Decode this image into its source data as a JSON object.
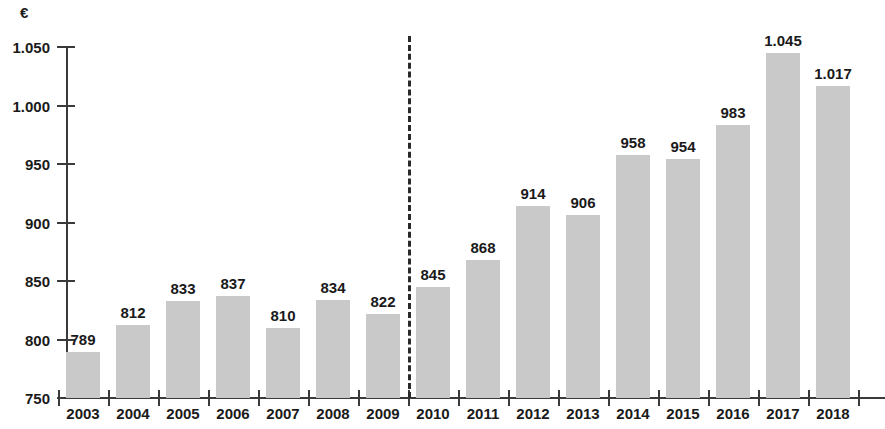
{
  "chart_data": {
    "type": "bar",
    "title": "",
    "subtitle": "",
    "xlabel": "",
    "ylabel": "",
    "unit_label": "€",
    "categories": [
      "2003",
      "2004",
      "2005",
      "2006",
      "2007",
      "2008",
      "2009",
      "2010",
      "2011",
      "2012",
      "2013",
      "2014",
      "2015",
      "2016",
      "2017",
      "2018"
    ],
    "values": [
      789,
      812,
      833,
      837,
      810,
      834,
      822,
      845,
      868,
      914,
      906,
      958,
      954,
      983,
      1045,
      1017
    ],
    "value_labels": [
      "789",
      "812",
      "833",
      "837",
      "810",
      "834",
      "822",
      "845",
      "868",
      "914",
      "906",
      "958",
      "954",
      "983",
      "1.045",
      "1.017"
    ],
    "ylim": [
      750,
      1050
    ],
    "y_ticks": [
      750,
      800,
      850,
      900,
      950,
      1000,
      1050
    ],
    "y_tick_labels": [
      "750",
      "800",
      "850",
      "900",
      "950",
      "1.000",
      "1.050"
    ],
    "grid": false,
    "legend": false,
    "legend_position": "none",
    "bar_color": "#c9c9c9",
    "axis_color": "#3a3a3a",
    "text_color": "#1a1a1a",
    "annotations": [
      {
        "type": "vertical-dashed-line",
        "name": "series-break-divider",
        "between": [
          "2009",
          "2010"
        ],
        "style": "dashed",
        "color": "#2a2a2a"
      }
    ]
  }
}
